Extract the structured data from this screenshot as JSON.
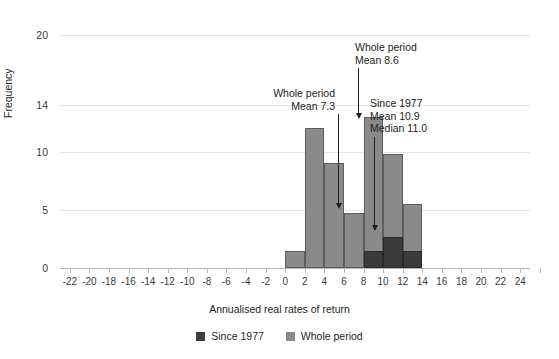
{
  "chart_data": {
    "type": "bar",
    "title": "",
    "xlabel": "Annualised real rates of return",
    "ylabel": "Frequency",
    "xlim": [
      -23,
      25
    ],
    "ylim": [
      0,
      20
    ],
    "grid": true,
    "legend_position": "bottom",
    "x_ticks": [
      "-22",
      "-20",
      "-18",
      "-16",
      "-14",
      "-12",
      "-10",
      "-8",
      "-6",
      "-4",
      "-2",
      "0",
      "2",
      "4",
      "6",
      "8",
      "10",
      "12",
      "14",
      "16",
      "18",
      "20",
      "22",
      "24"
    ],
    "x_tick_values": [
      -22,
      -20,
      -18,
      -16,
      -14,
      -12,
      -10,
      -8,
      -6,
      -4,
      -2,
      0,
      2,
      4,
      6,
      8,
      10,
      12,
      14,
      16,
      18,
      20,
      22,
      24
    ],
    "y_ticks": [
      "0",
      "5",
      "10",
      "14",
      "20"
    ],
    "y_tick_values": [
      0,
      5,
      10,
      14,
      20
    ],
    "bin_width": 2,
    "series": [
      {
        "name": "Whole period",
        "color": "#8a8a8a",
        "bins": [
          {
            "start": 0,
            "end": 2,
            "value": 1.5
          },
          {
            "start": 2,
            "end": 4,
            "value": 12.0
          },
          {
            "start": 4,
            "end": 6,
            "value": 9.0
          },
          {
            "start": 6,
            "end": 8,
            "value": 4.7
          },
          {
            "start": 8,
            "end": 10,
            "value": 13.0
          },
          {
            "start": 10,
            "end": 12,
            "value": 9.8
          },
          {
            "start": 12,
            "end": 14,
            "value": 5.5
          }
        ]
      },
      {
        "name": "Since 1977",
        "color": "#3b3b3b",
        "bins": [
          {
            "start": 8,
            "end": 10,
            "value": 1.5
          },
          {
            "start": 10,
            "end": 12,
            "value": 2.7
          },
          {
            "start": 12,
            "end": 14,
            "value": 1.5
          }
        ]
      }
    ],
    "annotations": [
      {
        "id": "whole-period-mean",
        "lines": [
          "Whole period",
          "Mean 8.6"
        ],
        "align": "left",
        "x_value": 8.6,
        "text_left": 355,
        "text_top": 41,
        "line_top": 68,
        "line_bottom": 119,
        "line_x": 358
      },
      {
        "id": "whole-period-mean-7-3",
        "lines": [
          "Whole period",
          "Mean 7.3"
        ],
        "align": "right",
        "x_value": 7.3,
        "text_left": 215,
        "text_top": 87,
        "line_top": 114,
        "line_bottom": 209,
        "line_x": 338
      },
      {
        "id": "since-1977-stats",
        "lines": [
          "Since 1977",
          "Mean 10.9",
          "Median 11.0"
        ],
        "align": "left",
        "x_value": 10.9,
        "text_left": 370,
        "text_top": 97,
        "line_top": 137,
        "line_bottom": 231,
        "line_x": 374
      }
    ],
    "legend": [
      {
        "label": "Since 1977",
        "swatch": "since"
      },
      {
        "label": "Whole period",
        "swatch": "whole"
      }
    ]
  }
}
